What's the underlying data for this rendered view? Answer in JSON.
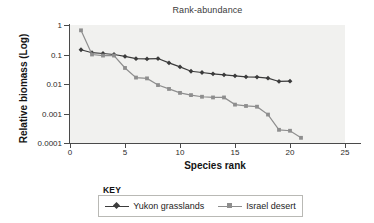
{
  "chart_data": {
    "type": "line",
    "title": "Rank-abundance",
    "xlabel": "Species rank",
    "ylabel": "Relative biomass (Log)",
    "yscale": "log",
    "ylim": [
      0.0001,
      1
    ],
    "xlim": [
      0,
      25
    ],
    "grid": false,
    "legend_position": "bottom",
    "legend_title": "KEY",
    "x_ticks": [
      "0",
      "5",
      "10",
      "15",
      "20",
      "25"
    ],
    "y_ticks": [
      "1",
      "0.1",
      "0.01",
      "0.001",
      "0.0001"
    ],
    "series": [
      {
        "name": "Yukon grasslands",
        "color": "#3b3b3b",
        "marker": "diamond",
        "x": [
          1,
          2,
          3,
          4,
          5,
          6,
          7,
          8,
          9,
          10,
          11,
          12,
          13,
          14,
          15,
          16,
          17,
          18,
          19,
          20
        ],
        "values": [
          0.145,
          0.115,
          0.108,
          0.1,
          0.086,
          0.072,
          0.071,
          0.073,
          0.052,
          0.038,
          0.027,
          0.0245,
          0.0222,
          0.0205,
          0.019,
          0.0175,
          0.0172,
          0.0158,
          0.0122,
          0.0125
        ]
      },
      {
        "name": "Israel desert",
        "color": "#8e8e8e",
        "marker": "square",
        "x": [
          1,
          2,
          3,
          4,
          5,
          6,
          7,
          8,
          9,
          10,
          11,
          12,
          13,
          14,
          15,
          16,
          17,
          18,
          19,
          20,
          21
        ],
        "values": [
          0.66,
          0.1,
          0.092,
          0.092,
          0.035,
          0.0165,
          0.0155,
          0.0092,
          0.0068,
          0.005,
          0.0042,
          0.0037,
          0.0035,
          0.0035,
          0.002,
          0.0018,
          0.0017,
          0.00092,
          0.00028,
          0.00026,
          0.00015
        ]
      }
    ]
  },
  "legend": {
    "key_label": "KEY",
    "entries": [
      {
        "label": "Yukon grasslands"
      },
      {
        "label": "Israel desert"
      }
    ]
  }
}
